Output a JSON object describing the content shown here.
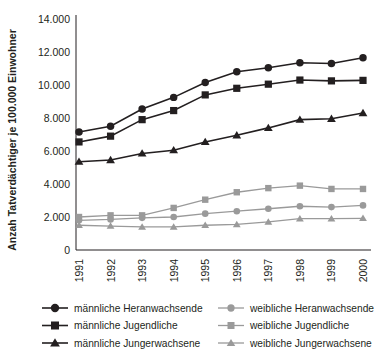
{
  "chart_data": {
    "type": "line",
    "title": "",
    "xlabel": "",
    "ylabel": "Anzah Tatverdächtiger je 100.000 Einwohner",
    "categories": [
      "1991",
      "1992",
      "1993",
      "1994",
      "1995",
      "1996",
      "1997",
      "1998",
      "1999",
      "2000"
    ],
    "x": [
      1991,
      1992,
      1993,
      1994,
      1995,
      1996,
      1997,
      1998,
      1999,
      2000
    ],
    "ylim": [
      0,
      14000
    ],
    "yticks": [
      0,
      2000,
      4000,
      6000,
      8000,
      10000,
      12000,
      14000
    ],
    "ytick_labels": [
      "0",
      "2.000",
      "4.000",
      "6.000",
      "8.000",
      "10.000",
      "12.000",
      "14.000"
    ],
    "grid": false,
    "legend_position": "below",
    "series": [
      {
        "name": "männliche Heranwachsende",
        "color": "#231f20",
        "marker": "circle",
        "values": [
          7150,
          7500,
          8550,
          9250,
          10150,
          10800,
          11050,
          11350,
          11300,
          11650
        ]
      },
      {
        "name": "männliche Jugendliche",
        "color": "#231f20",
        "marker": "square",
        "values": [
          6550,
          6900,
          7900,
          8450,
          9400,
          9800,
          10050,
          10300,
          10250,
          10280
        ]
      },
      {
        "name": "männliche Jungerwachsene",
        "color": "#231f20",
        "marker": "triangle",
        "values": [
          5350,
          5450,
          5850,
          6050,
          6550,
          6950,
          7400,
          7900,
          7950,
          8300
        ]
      },
      {
        "name": "weibliche Heranwachsende",
        "color": "#9a9a9a",
        "marker": "circle",
        "values": [
          1800,
          1850,
          1950,
          2000,
          2200,
          2350,
          2500,
          2650,
          2600,
          2700
        ]
      },
      {
        "name": "weibliche Jugendliche",
        "color": "#9a9a9a",
        "marker": "square",
        "values": [
          2000,
          2100,
          2100,
          2550,
          3050,
          3500,
          3750,
          3900,
          3700,
          3700
        ]
      },
      {
        "name": "weibliche Jungerwachsene",
        "color": "#9a9a9a",
        "marker": "triangle",
        "values": [
          1500,
          1450,
          1400,
          1400,
          1500,
          1550,
          1700,
          1900,
          1900,
          1920
        ]
      }
    ]
  },
  "legend": {
    "entries": [
      {
        "label": "männliche Heranwachsende",
        "color": "#231f20",
        "marker": "circle",
        "col": 0,
        "row": 0
      },
      {
        "label": "männliche Jugendliche",
        "color": "#231f20",
        "marker": "square",
        "col": 0,
        "row": 1
      },
      {
        "label": "männliche Jungerwachsene",
        "color": "#231f20",
        "marker": "triangle",
        "col": 0,
        "row": 2
      },
      {
        "label": "weibliche Heranwachsende",
        "color": "#9a9a9a",
        "marker": "circle",
        "col": 1,
        "row": 0
      },
      {
        "label": "weibliche Jugendliche",
        "color": "#9a9a9a",
        "marker": "square",
        "col": 1,
        "row": 1
      },
      {
        "label": "weibliche Jungerwachsene",
        "color": "#9a9a9a",
        "marker": "triangle",
        "col": 1,
        "row": 2
      }
    ]
  },
  "colors": {
    "male_series": "#231f20",
    "female_series": "#9a9a9a",
    "background": "#ffffff",
    "axis": "#231f20"
  }
}
